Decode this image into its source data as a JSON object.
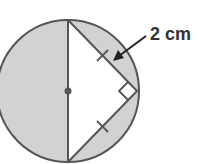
{
  "diagram": {
    "label": "2 cm",
    "colors": {
      "shade": "#d2d2d2",
      "stroke": "#555555",
      "background": "#ffffff",
      "text": "#333333"
    },
    "shapes": {
      "circle": {
        "cx": 68,
        "cy": 91,
        "r": 71
      },
      "diameter": {
        "x1": 68,
        "y1": 20,
        "x2": 68,
        "y2": 162
      },
      "triangle_vertex": {
        "x": 137,
        "y": 91
      },
      "center_dot_radius": 3.5
    },
    "annotations": {
      "right_angle_marker": true,
      "equal_side_ticks": 2,
      "arrow_points_to": "upper chord"
    }
  }
}
